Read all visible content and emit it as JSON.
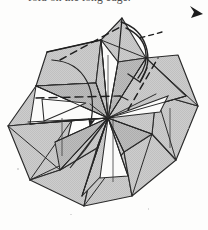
{
  "page": {
    "width": 208,
    "height": 230,
    "background_color": "#fdfdfc",
    "kind": "scanned-line-diagram"
  },
  "caption": {
    "text": "fold on the long edge.",
    "note": "clipped caption fragment, only glyph descenders visible at top edge"
  },
  "figure": {
    "name": "pinwheel-rotational-fold-diagram",
    "center": {
      "x": 108,
      "y": 118
    },
    "petal_count": 8
  },
  "colors": {
    "ink": "#262626",
    "ink_soft": "#3d3d3d",
    "fill_gray": "#c9c9c9",
    "fill_gray_dark": "#b4b4b4",
    "fill_white": "#fbfbfa",
    "paper": "#fdfdfc"
  },
  "panels": [
    {
      "id": "panel-top-peak",
      "fill": "gray",
      "label": "top peak flap"
    },
    {
      "id": "panel-top-right",
      "fill": "gray",
      "label": "upper right flap"
    },
    {
      "id": "panel-right",
      "fill": "gray",
      "label": "right flap"
    },
    {
      "id": "panel-lower-right",
      "fill": "gray",
      "label": "lower right flap"
    },
    {
      "id": "panel-bottom",
      "fill": "gray",
      "label": "bottom flap"
    },
    {
      "id": "panel-lower-left",
      "fill": "gray",
      "label": "lower left flap"
    },
    {
      "id": "panel-left",
      "fill": "gray",
      "label": "left flap"
    },
    {
      "id": "panel-upper-left",
      "fill": "gray",
      "label": "upper left flap"
    }
  ],
  "annotations": [
    {
      "id": "dashed-fold-upper",
      "type": "dashed-line",
      "label": "upper diagonal fold line"
    },
    {
      "id": "dashed-fold-horizontal",
      "type": "dashed-line",
      "label": "horizontal fold line"
    },
    {
      "id": "dashed-fold-right",
      "type": "dashed-line",
      "label": "right diagonal fold line"
    },
    {
      "id": "dashed-tick-right",
      "type": "dashed-line",
      "label": "short right tick"
    },
    {
      "id": "arrow-fold-left",
      "type": "solid-arrow",
      "label": "fold direction arrow toward center"
    },
    {
      "id": "arrow-rotation",
      "type": "curved-arrow",
      "label": "rotation arrow at top"
    },
    {
      "id": "arrow-corner-marker",
      "type": "arrowhead",
      "label": "page corner arrowhead marker"
    }
  ]
}
